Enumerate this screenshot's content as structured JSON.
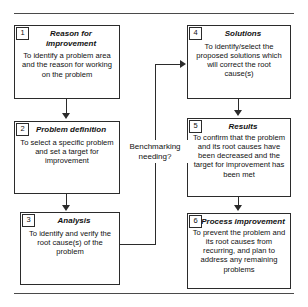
{
  "figure": {
    "mid_label": "Benchmarking needing?"
  },
  "boxes": [
    {
      "num": "1",
      "title": "Reason for improvement",
      "body": "To identify a problem area and the reason for working on the problem"
    },
    {
      "num": "2",
      "title": "Problem definition",
      "body": "To select a specific problem and set a target for improvement"
    },
    {
      "num": "3",
      "title": "Analysis",
      "body": "To identify and verify the root cause(s) of the problem"
    },
    {
      "num": "4",
      "title": "Solutions",
      "body": "To identify/select the proposed solutions which will correct the root cause(s)"
    },
    {
      "num": "5",
      "title": "Results",
      "body": "To confirm that the problem and its root causes have been decreased and the target for improvement has been met"
    },
    {
      "num": "6",
      "title": "Process improvement",
      "body": "To prevent the problem and its root causes from recurring, and plan to address any remaining problems"
    }
  ],
  "colors": {
    "stroke": "#2b2b2b",
    "rule": "#4a4a4a",
    "background": "#ffffff",
    "text": "#111111"
  }
}
